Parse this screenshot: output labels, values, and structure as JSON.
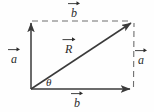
{
  "figure": {
    "background_color": "#fefefe",
    "stroke_color": "#3a3a3a",
    "dashed_color": "#6e6e6e",
    "text_color": "#2b2b2b",
    "labels": {
      "b_top": "b",
      "b_bottom": "b",
      "a_left": "a",
      "a_right": "a",
      "resultant": "R",
      "angle": "θ"
    },
    "geometry": {
      "origin": [
        31,
        89
      ],
      "top_left": [
        31,
        21
      ],
      "top_right": [
        134,
        21
      ],
      "bottom_right": [
        133,
        89
      ]
    },
    "vectors": [
      {
        "name": "a-left-solid",
        "label": "a",
        "style": "solid",
        "from": [
          31,
          89
        ],
        "to": [
          31,
          21
        ]
      },
      {
        "name": "b-bottom-solid",
        "label": "b",
        "style": "solid",
        "from": [
          31,
          89
        ],
        "to": [
          133,
          89
        ]
      },
      {
        "name": "resultant-solid",
        "label": "R",
        "style": "solid",
        "from": [
          31,
          89
        ],
        "to": [
          134,
          21
        ]
      },
      {
        "name": "b-top-dashed",
        "label": "b",
        "style": "dashed",
        "from": [
          31,
          21
        ],
        "to": [
          134,
          21
        ]
      },
      {
        "name": "a-right-dashed",
        "label": "a",
        "style": "dashed",
        "from": [
          133,
          89
        ],
        "to": [
          134,
          21
        ]
      }
    ]
  }
}
